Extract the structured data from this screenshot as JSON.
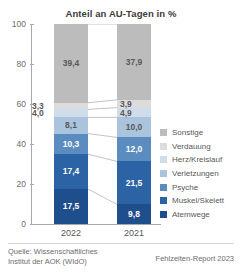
{
  "chart_data": {
    "type": "bar",
    "title": "Anteil an AU-Tagen in %",
    "xlabel": "",
    "ylabel": "",
    "ylim": [
      0,
      100
    ],
    "yticks": [
      0,
      20,
      40,
      60,
      80,
      100
    ],
    "ytick_labels": [
      "0",
      "20",
      "40",
      "60",
      "80",
      "100"
    ],
    "grid": false,
    "stacked": true,
    "legend_position": "right",
    "categories": [
      "2022",
      "2021"
    ],
    "series": [
      {
        "name": "Atemwege",
        "color": "#1f4e8c",
        "values": [
          17.5,
          9.8
        ],
        "labels": [
          "17,5",
          "9,8"
        ]
      },
      {
        "name": "Muskel/Skelett",
        "color": "#2b63a4",
        "values": [
          17.4,
          21.5
        ],
        "labels": [
          "17,4",
          "21,5"
        ]
      },
      {
        "name": "Psyche",
        "color": "#5b8cc0",
        "values": [
          10.3,
          12.0
        ],
        "labels": [
          "10,3",
          "12,0"
        ]
      },
      {
        "name": "Verletzungen",
        "color": "#aac4de",
        "values": [
          8.1,
          10.0
        ],
        "labels": [
          "8,1",
          "10,0"
        ]
      },
      {
        "name": "Herz/Kreislauf",
        "color": "#cfdcea",
        "values": [
          4.0,
          4.9
        ],
        "labels": [
          "4,0",
          "4,9"
        ]
      },
      {
        "name": "Verdauung",
        "color": "#dcdcdc",
        "values": [
          3.3,
          3.9
        ],
        "labels": [
          "3,3",
          "3,9"
        ]
      },
      {
        "name": "Sonstige",
        "color": "#bcbcbc",
        "values": [
          39.4,
          37.9
        ],
        "labels": [
          "39,4",
          "37,9"
        ]
      }
    ],
    "legend_entries": [
      {
        "label": "Sonstige",
        "color": "#bcbcbc"
      },
      {
        "label": "Verdauung",
        "color": "#dcdcdc"
      },
      {
        "label": "Herz/Kreislauf",
        "color": "#cfdcea"
      },
      {
        "label": "Verletzungen",
        "color": "#aac4de"
      },
      {
        "label": "Psyche",
        "color": "#5b8cc0"
      },
      {
        "label": "Muskel/Skelett",
        "color": "#2b63a4"
      },
      {
        "label": "Atemwege",
        "color": "#1f4e8c"
      }
    ]
  },
  "footer": {
    "source": "Quelle: Wissenschaftliches\nInstitut der AOK (WIdO)",
    "report": "Fehlzeiten-Report 2023"
  }
}
